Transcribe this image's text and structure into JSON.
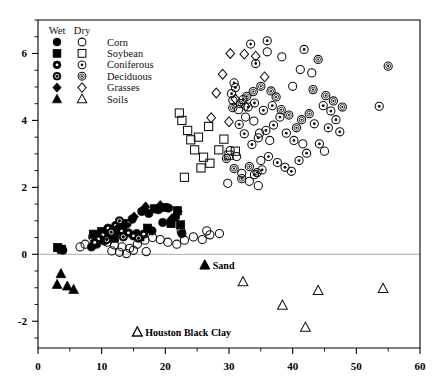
{
  "chart_data": {
    "type": "scatter",
    "title": "",
    "xlabel": "",
    "ylabel": "",
    "xlim": [
      0,
      60
    ],
    "ylim": [
      -2.8,
      7.0
    ],
    "xticks": [
      0,
      10,
      20,
      30,
      40,
      50,
      60
    ],
    "xticklabels": [
      "0",
      "10",
      "20",
      "30",
      "40",
      "50",
      "60"
    ],
    "xminorstep": 5,
    "yticks": [
      -2,
      0,
      2,
      4,
      6
    ],
    "yticklabels": [
      "-2",
      "0",
      "2",
      "4",
      "6"
    ],
    "yminorstep": 0.5,
    "grid": false,
    "zero_reference_line": 0,
    "legend": {
      "position": "top-left-inside",
      "columns": [
        "Wet",
        "Dry"
      ],
      "entries": [
        {
          "label": "Corn",
          "wet_marker": "filled-circle",
          "dry_marker": "open-circle"
        },
        {
          "label": "Soybean",
          "wet_marker": "filled-square",
          "dry_marker": "open-square"
        },
        {
          "label": "Coniferous",
          "wet_marker": "filled-circle-white-dot",
          "dry_marker": "open-circle-dot"
        },
        {
          "label": "Deciduous",
          "wet_marker": "filled-circle-white-ring",
          "dry_marker": "open-circle-ring-dot"
        },
        {
          "label": "Grasses",
          "wet_marker": "filled-diamond",
          "dry_marker": "open-diamond"
        },
        {
          "label": "Soils",
          "wet_marker": "filled-triangle",
          "dry_marker": "open-triangle"
        }
      ]
    },
    "annotations": [
      {
        "text": "Sand",
        "marker": "filled-triangle",
        "x": 26.2,
        "y": -0.32
      },
      {
        "text": "Houston Black Clay",
        "marker": "open-triangle",
        "x": 15.6,
        "y": -2.32
      }
    ],
    "series": [
      {
        "name": "Corn (wet)",
        "marker": "filled-circle",
        "points": [
          [
            14.8,
            1.05
          ],
          [
            16.3,
            1.28
          ],
          [
            17.4,
            1.22
          ],
          [
            18.9,
            1.33
          ],
          [
            20.5,
            1.38
          ],
          [
            21.6,
            1.12
          ],
          [
            13.6,
            0.92
          ],
          [
            12.4,
            0.72
          ],
          [
            11.3,
            0.55
          ],
          [
            19.6,
            0.95
          ],
          [
            15.5,
            0.62
          ],
          [
            10.4,
            0.4
          ],
          [
            9.2,
            0.3
          ],
          [
            8.4,
            0.22
          ],
          [
            3.3,
            0.18
          ],
          [
            3.9,
            0.12
          ],
          [
            22.6,
            0.62
          ],
          [
            17.9,
            0.7
          ]
        ]
      },
      {
        "name": "Soybean (wet)",
        "marker": "filled-square",
        "points": [
          [
            18.3,
            1.36
          ],
          [
            19.8,
            1.4
          ],
          [
            21.9,
            1.3
          ],
          [
            20.9,
            0.92
          ],
          [
            17.2,
            0.78
          ],
          [
            13.0,
            0.85
          ],
          [
            11.6,
            0.72
          ],
          [
            10.0,
            0.68
          ],
          [
            8.7,
            0.6
          ],
          [
            3.1,
            0.2
          ],
          [
            3.7,
            0.15
          ],
          [
            22.4,
            0.88
          ],
          [
            16.0,
            0.52
          ],
          [
            12.0,
            0.48
          ]
        ]
      },
      {
        "name": "Coniferous (wet)",
        "marker": "filled-circle-white-dot",
        "points": [
          [
            11.0,
            0.78
          ],
          [
            12.2,
            0.86
          ],
          [
            13.1,
            0.7
          ],
          [
            14.2,
            0.64
          ],
          [
            10.2,
            0.58
          ],
          [
            9.5,
            0.46
          ],
          [
            15.0,
            0.55
          ],
          [
            16.6,
            0.6
          ],
          [
            8.9,
            0.35
          ]
        ]
      },
      {
        "name": "Deciduous (wet)",
        "marker": "filled-circle-white-ring",
        "points": [
          [
            12.8,
            1.0
          ],
          [
            14.0,
            0.92
          ],
          [
            11.5,
            0.66
          ],
          [
            13.4,
            0.52
          ],
          [
            10.8,
            0.44
          ],
          [
            15.8,
            0.48
          ]
        ]
      },
      {
        "name": "Grasses (wet)",
        "marker": "filled-diamond",
        "points": [
          [
            16.9,
            1.42
          ],
          [
            15.1,
            1.12
          ],
          [
            19.2,
            1.46
          ],
          [
            22.0,
            1.28
          ],
          [
            13.8,
            0.88
          ],
          [
            12.6,
            0.8
          ],
          [
            21.0,
            1.06
          ]
        ]
      },
      {
        "name": "Soils (wet / Sand)",
        "marker": "filled-triangle",
        "points": [
          [
            3.6,
            -0.58
          ],
          [
            3.0,
            -0.9
          ],
          [
            4.6,
            -0.95
          ],
          [
            5.6,
            -1.05
          ],
          [
            26.2,
            -0.32
          ]
        ]
      },
      {
        "name": "Corn (dry)",
        "marker": "open-circle",
        "points": [
          [
            36.0,
            6.05
          ],
          [
            38.3,
            5.9
          ],
          [
            41.2,
            5.52
          ],
          [
            43.0,
            5.42
          ],
          [
            40.0,
            5.02
          ],
          [
            30.6,
            4.6
          ],
          [
            31.5,
            4.32
          ],
          [
            32.6,
            4.1
          ],
          [
            33.9,
            3.98
          ],
          [
            30.2,
            3.1
          ],
          [
            31.2,
            2.92
          ],
          [
            34.8,
            3.62
          ],
          [
            36.4,
            3.4
          ],
          [
            35.0,
            2.8
          ],
          [
            32.0,
            2.42
          ],
          [
            33.2,
            2.18
          ],
          [
            34.6,
            2.05
          ],
          [
            29.8,
            2.12
          ],
          [
            41.6,
            3.3
          ],
          [
            45.0,
            3.08
          ],
          [
            8.6,
            0.52
          ],
          [
            9.8,
            0.44
          ],
          [
            10.9,
            0.36
          ],
          [
            12.0,
            0.28
          ],
          [
            13.2,
            0.22
          ],
          [
            14.4,
            0.18
          ],
          [
            15.6,
            0.3
          ],
          [
            16.8,
            0.42
          ],
          [
            18.0,
            0.5
          ],
          [
            19.2,
            0.44
          ],
          [
            20.4,
            0.36
          ],
          [
            21.8,
            0.3
          ],
          [
            23.0,
            0.42
          ],
          [
            24.4,
            0.52
          ],
          [
            25.8,
            0.44
          ],
          [
            27.0,
            0.58
          ],
          [
            7.4,
            0.3
          ],
          [
            6.6,
            0.22
          ],
          [
            11.6,
            0.1
          ],
          [
            12.8,
            0.06
          ],
          [
            13.9,
            0.02
          ],
          [
            15.0,
            0.12
          ],
          [
            17.0,
            0.08
          ],
          [
            22.5,
            0.68
          ],
          [
            26.5,
            0.7
          ],
          [
            28.5,
            0.62
          ]
        ]
      },
      {
        "name": "Soybean (dry)",
        "marker": "open-square",
        "points": [
          [
            22.2,
            4.22
          ],
          [
            22.6,
            4.0
          ],
          [
            23.5,
            3.7
          ],
          [
            24.0,
            3.42
          ],
          [
            25.2,
            3.5
          ],
          [
            24.6,
            3.12
          ],
          [
            26.0,
            2.9
          ],
          [
            25.6,
            2.58
          ],
          [
            27.0,
            2.72
          ],
          [
            23.0,
            2.3
          ],
          [
            28.4,
            3.12
          ],
          [
            29.2,
            3.44
          ],
          [
            26.8,
            3.82
          ],
          [
            30.0,
            2.96
          ],
          [
            31.0,
            3.08
          ]
        ]
      },
      {
        "name": "Coniferous (dry)",
        "marker": "open-circle-dot",
        "points": [
          [
            33.4,
            6.28
          ],
          [
            36.0,
            6.38
          ],
          [
            41.8,
            6.12
          ],
          [
            34.2,
            5.7
          ],
          [
            30.8,
            5.12
          ],
          [
            30.4,
            4.8
          ],
          [
            32.2,
            4.62
          ],
          [
            33.0,
            4.4
          ],
          [
            34.0,
            4.52
          ],
          [
            35.4,
            4.3
          ],
          [
            36.8,
            4.44
          ],
          [
            38.0,
            4.1
          ],
          [
            37.0,
            3.86
          ],
          [
            35.8,
            3.7
          ],
          [
            34.6,
            3.48
          ],
          [
            33.6,
            3.28
          ],
          [
            32.4,
            3.6
          ],
          [
            31.6,
            3.88
          ],
          [
            39.0,
            3.62
          ],
          [
            40.2,
            3.4
          ],
          [
            44.8,
            4.44
          ],
          [
            46.0,
            4.28
          ],
          [
            46.8,
            4.02
          ],
          [
            45.6,
            3.78
          ],
          [
            47.4,
            3.66
          ],
          [
            44.2,
            3.3
          ],
          [
            43.4,
            3.9
          ],
          [
            36.2,
            2.92
          ],
          [
            37.6,
            2.74
          ],
          [
            38.8,
            2.6
          ],
          [
            39.8,
            2.48
          ],
          [
            35.2,
            2.52
          ],
          [
            34.0,
            2.38
          ],
          [
            41.0,
            2.8
          ],
          [
            42.2,
            3.02
          ],
          [
            31.0,
            4.98
          ],
          [
            53.6,
            4.42
          ]
        ]
      },
      {
        "name": "Deciduous (dry)",
        "marker": "open-circle-ring-dot",
        "points": [
          [
            44.0,
            5.82
          ],
          [
            43.2,
            4.92
          ],
          [
            45.2,
            4.74
          ],
          [
            42.6,
            4.2
          ],
          [
            41.4,
            4.02
          ],
          [
            40.6,
            3.78
          ],
          [
            39.4,
            4.16
          ],
          [
            38.2,
            4.32
          ],
          [
            37.4,
            4.7
          ],
          [
            36.6,
            4.88
          ],
          [
            35.0,
            5.02
          ],
          [
            33.8,
            4.86
          ],
          [
            32.8,
            4.72
          ],
          [
            31.8,
            4.5
          ],
          [
            30.6,
            4.38
          ],
          [
            33.2,
            2.62
          ],
          [
            34.4,
            2.44
          ],
          [
            32.0,
            2.26
          ],
          [
            30.8,
            2.56
          ],
          [
            29.6,
            2.86
          ],
          [
            46.4,
            4.58
          ],
          [
            47.8,
            4.4
          ],
          [
            55.0,
            5.62
          ]
        ]
      },
      {
        "name": "Grasses (dry)",
        "marker": "open-diamond",
        "points": [
          [
            30.2,
            6.0
          ],
          [
            32.4,
            5.98
          ],
          [
            29.0,
            5.38
          ],
          [
            28.0,
            4.82
          ],
          [
            31.0,
            4.64
          ],
          [
            32.6,
            4.42
          ],
          [
            30.0,
            3.96
          ],
          [
            34.2,
            5.92
          ],
          [
            27.2,
            4.08
          ],
          [
            35.6,
            5.3
          ]
        ]
      },
      {
        "name": "Soils (dry / Houston Black Clay)",
        "marker": "open-triangle",
        "points": [
          [
            32.2,
            -0.82
          ],
          [
            38.4,
            -1.52
          ],
          [
            44.0,
            -1.08
          ],
          [
            42.0,
            -2.18
          ],
          [
            54.2,
            -1.02
          ],
          [
            15.6,
            -2.32
          ]
        ]
      }
    ]
  }
}
